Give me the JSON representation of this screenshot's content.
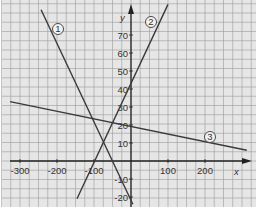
{
  "chart_data": {
    "type": "line",
    "title": "",
    "xlabel": "x",
    "ylabel": "y",
    "xlim": [
      -350,
      330
    ],
    "ylim": [
      -25,
      88
    ],
    "grid": true,
    "x_ticks": [
      -300,
      -200,
      -100,
      100,
      200
    ],
    "y_ticks": [
      -20,
      -10,
      10,
      20,
      30,
      40,
      50,
      60,
      70
    ],
    "x_tick_labels": [
      "-300",
      "-200",
      "-100",
      "100",
      "200"
    ],
    "y_tick_labels": [
      "-20",
      "-10",
      "10",
      "20",
      "30",
      "40",
      "50",
      "60",
      "70"
    ],
    "series": [
      {
        "name": "1",
        "label": "①",
        "equation": "y = -0.43x - 22",
        "x": [
          -243,
          5
        ],
        "y": [
          84,
          -24
        ]
      },
      {
        "name": "2",
        "label": "②",
        "equation": "y = 0.4x + 40",
        "x": [
          -146,
          100
        ],
        "y": [
          -21,
          87
        ]
      },
      {
        "name": "3",
        "label": "③",
        "equation": "y = -x/24 + 20",
        "x": [
          -327,
          313
        ],
        "y": [
          33,
          6
        ]
      }
    ],
    "annotations": [
      "①",
      "②",
      "③"
    ]
  },
  "colors": {
    "background": "#e6e6e6",
    "grid": "#9a9a9a",
    "axis": "#222222",
    "line": "#3a3a3a"
  }
}
